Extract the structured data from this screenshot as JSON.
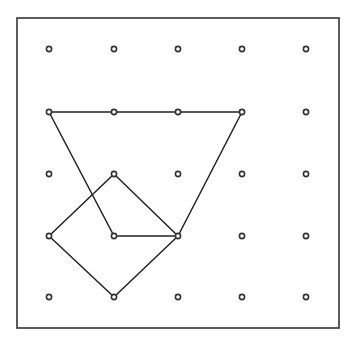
{
  "diagram": {
    "type": "geoboard",
    "frame": {
      "x": 17,
      "y": 18,
      "width": 322,
      "height": 310,
      "stroke": "#333333"
    },
    "grid": {
      "columns": [
        49,
        114,
        178,
        242,
        306
      ],
      "rows": [
        49,
        112,
        174,
        236,
        297
      ],
      "dot_radius": 2.6,
      "dot_stroke": "#333333"
    },
    "shapes": [
      {
        "name": "trapezoid",
        "grid_points": [
          [
            0,
            1
          ],
          [
            3,
            1
          ],
          [
            2,
            3
          ],
          [
            1,
            3
          ]
        ],
        "points": "49,112 242,112 178,236 114,236"
      },
      {
        "name": "square",
        "grid_points": [
          [
            1,
            2
          ],
          [
            2,
            3
          ],
          [
            1,
            4
          ],
          [
            0,
            3
          ]
        ],
        "points": "114,174 178,236 114,297 49,236"
      }
    ],
    "line_color": "#222222"
  }
}
